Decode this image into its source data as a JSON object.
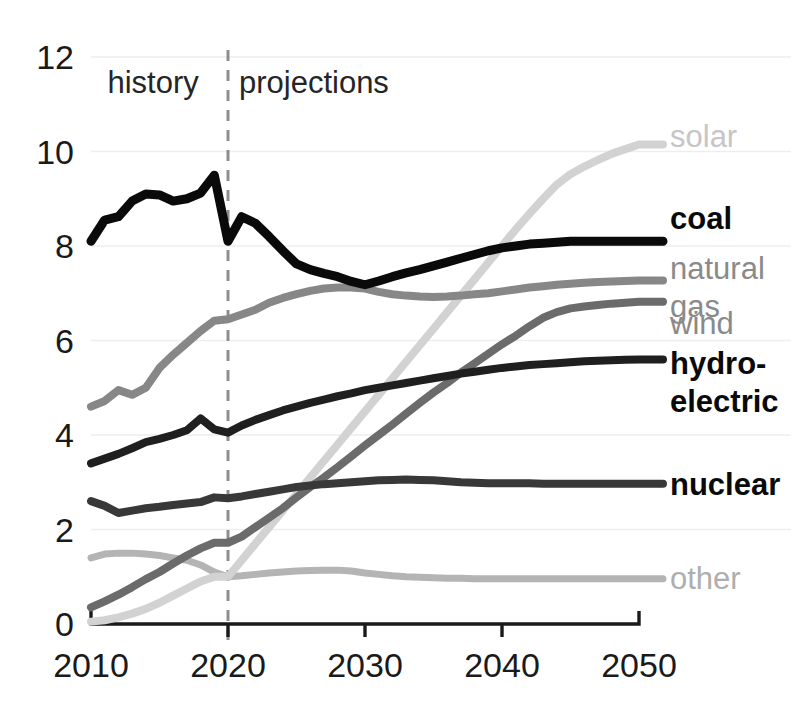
{
  "chart_data": {
    "type": "line",
    "title": "",
    "xlabel": "",
    "ylabel": "",
    "xlim": [
      2010,
      2050
    ],
    "ylim": [
      0,
      12
    ],
    "grid": true,
    "legend_position": "right",
    "xticks": [
      "2010",
      "2020",
      "2030",
      "2040",
      "2050"
    ],
    "yticks": [
      "0",
      "2",
      "4",
      "6",
      "8",
      "10",
      "12"
    ],
    "annotations": [
      {
        "text": "history",
        "x": 2011.2,
        "y": 11.5
      },
      {
        "text": "projections",
        "x": 2020.8,
        "y": 11.5
      }
    ],
    "divider": {
      "x": 2020,
      "style": "dashed",
      "label_left": "history",
      "label_right": "projections"
    },
    "x": [
      2010,
      2011,
      2012,
      2013,
      2014,
      2015,
      2016,
      2017,
      2018,
      2019,
      2020,
      2021,
      2022,
      2023,
      2024,
      2025,
      2026,
      2027,
      2028,
      2029,
      2030,
      2031,
      2032,
      2033,
      2034,
      2035,
      2036,
      2037,
      2038,
      2039,
      2040,
      2041,
      2042,
      2043,
      2044,
      2045,
      2046,
      2047,
      2048,
      2049,
      2050
    ],
    "series": [
      {
        "name": "coal",
        "color": "#0a0a0a",
        "label_color": "#0a0a0a",
        "label_bold": true,
        "label_y": 8.62,
        "values": [
          8.1,
          8.55,
          8.62,
          8.95,
          9.1,
          9.08,
          8.95,
          9.0,
          9.12,
          9.5,
          8.1,
          8.62,
          8.48,
          8.2,
          7.9,
          7.62,
          7.5,
          7.42,
          7.35,
          7.25,
          7.18,
          7.26,
          7.35,
          7.43,
          7.5,
          7.58,
          7.66,
          7.74,
          7.82,
          7.9,
          7.96,
          8.0,
          8.04,
          8.06,
          8.08,
          8.1,
          8.1,
          8.1,
          8.1,
          8.1,
          8.1
        ]
      },
      {
        "name": "natural gas",
        "color": "#878787",
        "label_color": "#8a8a8a",
        "label_bold": false,
        "label_y": 7.55,
        "values": [
          4.6,
          4.72,
          4.95,
          4.85,
          5.0,
          5.42,
          5.7,
          5.95,
          6.2,
          6.42,
          6.45,
          6.55,
          6.65,
          6.8,
          6.9,
          6.98,
          7.05,
          7.1,
          7.12,
          7.12,
          7.1,
          7.03,
          6.98,
          6.95,
          6.93,
          6.92,
          6.93,
          6.95,
          6.98,
          7.0,
          7.04,
          7.08,
          7.12,
          7.15,
          7.18,
          7.2,
          7.22,
          7.24,
          7.25,
          7.26,
          7.27
        ]
      },
      {
        "name": "wind",
        "color": "#6b6b6b",
        "label_color": "#8a8a8a",
        "label_bold": false,
        "label_y": 6.4,
        "values": [
          0.35,
          0.48,
          0.62,
          0.78,
          0.95,
          1.1,
          1.28,
          1.45,
          1.6,
          1.72,
          1.72,
          1.85,
          2.05,
          2.25,
          2.45,
          2.68,
          2.9,
          3.1,
          3.32,
          3.55,
          3.78,
          4.0,
          4.22,
          4.45,
          4.68,
          4.9,
          5.1,
          5.32,
          5.52,
          5.72,
          5.92,
          6.1,
          6.3,
          6.48,
          6.6,
          6.68,
          6.72,
          6.75,
          6.78,
          6.8,
          6.82
        ]
      },
      {
        "name": "hydro-electric",
        "color": "#1f1f1f",
        "label_color": "#0a0a0a",
        "label_bold": true,
        "label_y": 5.55,
        "values": [
          3.4,
          3.5,
          3.6,
          3.72,
          3.85,
          3.92,
          4.0,
          4.1,
          4.35,
          4.12,
          4.05,
          4.2,
          4.32,
          4.42,
          4.52,
          4.6,
          4.68,
          4.75,
          4.82,
          4.88,
          4.95,
          5.0,
          5.05,
          5.1,
          5.15,
          5.2,
          5.25,
          5.3,
          5.34,
          5.38,
          5.42,
          5.45,
          5.48,
          5.5,
          5.52,
          5.54,
          5.56,
          5.57,
          5.58,
          5.59,
          5.6
        ]
      },
      {
        "name": "nuclear",
        "color": "#383838",
        "label_color": "#0a0a0a",
        "label_bold": true,
        "label_y": 2.98,
        "values": [
          2.6,
          2.5,
          2.35,
          2.4,
          2.45,
          2.48,
          2.52,
          2.55,
          2.58,
          2.68,
          2.66,
          2.7,
          2.75,
          2.8,
          2.85,
          2.9,
          2.93,
          2.96,
          2.98,
          3.0,
          3.02,
          3.04,
          3.05,
          3.06,
          3.05,
          3.04,
          3.02,
          3.0,
          2.99,
          2.98,
          2.98,
          2.98,
          2.98,
          2.97,
          2.97,
          2.97,
          2.97,
          2.97,
          2.97,
          2.97,
          2.97
        ]
      },
      {
        "name": "solar",
        "color": "#d2d2d2",
        "label_color": "#c6c6c6",
        "label_bold": false,
        "label_y": 10.35,
        "values": [
          0.05,
          0.08,
          0.14,
          0.22,
          0.32,
          0.45,
          0.6,
          0.75,
          0.9,
          1.0,
          1.0,
          1.35,
          1.7,
          2.05,
          2.4,
          2.75,
          3.1,
          3.45,
          3.8,
          4.15,
          4.5,
          4.85,
          5.2,
          5.55,
          5.9,
          6.25,
          6.6,
          6.95,
          7.3,
          7.65,
          8.0,
          8.35,
          8.68,
          9.0,
          9.3,
          9.52,
          9.68,
          9.82,
          9.95,
          10.05,
          10.15
        ]
      },
      {
        "name": "other",
        "color": "#b4b4b4",
        "label_color": "#aeaeae",
        "label_bold": false,
        "label_y": 1.0,
        "values": [
          1.4,
          1.48,
          1.5,
          1.5,
          1.48,
          1.45,
          1.4,
          1.35,
          1.25,
          1.1,
          1.0,
          1.02,
          1.05,
          1.08,
          1.1,
          1.12,
          1.13,
          1.14,
          1.14,
          1.12,
          1.08,
          1.05,
          1.02,
          1.0,
          0.99,
          0.98,
          0.97,
          0.97,
          0.96,
          0.96,
          0.96,
          0.96,
          0.96,
          0.96,
          0.96,
          0.96,
          0.96,
          0.96,
          0.96,
          0.96,
          0.96
        ]
      }
    ],
    "legend": [
      {
        "name": "solar",
        "lines": [
          "solar"
        ],
        "color": "#c6c6c6",
        "bold": false,
        "y": 10.35
      },
      {
        "name": "coal",
        "lines": [
          "coal"
        ],
        "color": "#0a0a0a",
        "bold": true,
        "y": 8.62
      },
      {
        "name": "natural gas",
        "lines": [
          "natural",
          "gas"
        ],
        "color": "#8a8a8a",
        "bold": false,
        "y": 7.55
      },
      {
        "name": "wind",
        "lines": [
          "wind"
        ],
        "color": "#8a8a8a",
        "bold": false,
        "y": 6.4
      },
      {
        "name": "hydro-electric",
        "lines": [
          "hydro-",
          "electric"
        ],
        "color": "#0a0a0a",
        "bold": true,
        "y": 5.55
      },
      {
        "name": "nuclear",
        "lines": [
          "nuclear"
        ],
        "color": "#0a0a0a",
        "bold": true,
        "y": 2.98
      },
      {
        "name": "other",
        "lines": [
          "other"
        ],
        "color": "#aeaeae",
        "bold": false,
        "y": 1.0
      }
    ],
    "gridline_color": "#eeeeee",
    "axis_color": "#1a1a1a",
    "divider_color": "#8e8e8e"
  }
}
